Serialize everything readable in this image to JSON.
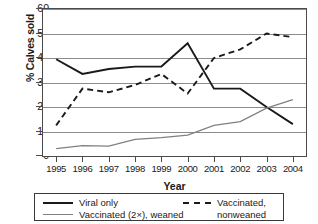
{
  "chart_data": {
    "type": "line",
    "title": "",
    "xlabel": "Year",
    "ylabel": "% Calves sold",
    "categories": [
      "1995",
      "1996",
      "1997",
      "1998",
      "1999",
      "2000",
      "2001",
      "2002",
      "2003",
      "2004"
    ],
    "x": [
      1995,
      1996,
      1997,
      1998,
      1999,
      2000,
      2001,
      2002,
      2003,
      2004
    ],
    "ylim": [
      0,
      60
    ],
    "yticks": [
      0,
      10,
      20,
      30,
      40,
      50,
      60
    ],
    "grid": "horizontal",
    "legend_position": "bottom",
    "series": [
      {
        "name": "Viral only",
        "style": "solid",
        "color": "#1a1a1a",
        "values": [
          39.5,
          33.5,
          35.5,
          36.5,
          36.5,
          46.0,
          27.5,
          27.5,
          20.0,
          13.0
        ]
      },
      {
        "name": "Vaccinated, nonweaned",
        "style": "dashed",
        "color": "#1a1a1a",
        "values": [
          12.5,
          27.5,
          26.0,
          29.0,
          33.5,
          25.5,
          40.0,
          43.5,
          50.0,
          48.5
        ]
      },
      {
        "name": "Vaccinated (2×), weaned",
        "style": "solid",
        "color": "#808080",
        "values": [
          3.0,
          4.2,
          4.0,
          6.8,
          7.5,
          8.5,
          12.5,
          14.0,
          19.5,
          23.0
        ]
      }
    ]
  },
  "axis": {
    "y_title": "% Calves sold",
    "x_title": "Year",
    "y_ticks": [
      "0",
      "10",
      "20",
      "30",
      "40",
      "50",
      "60"
    ],
    "x_ticks": [
      "1995",
      "1996",
      "1997",
      "1998",
      "1999",
      "2000",
      "2001",
      "2002",
      "2003",
      "2004"
    ]
  },
  "legend": {
    "entries": [
      {
        "label": "Viral only",
        "swatch": "solid-dark"
      },
      {
        "label": "Vaccinated (2×), weaned",
        "swatch": "solid-gray"
      },
      {
        "label": "Vaccinated,",
        "label2": "nonweaned",
        "swatch": "dashed"
      }
    ]
  }
}
